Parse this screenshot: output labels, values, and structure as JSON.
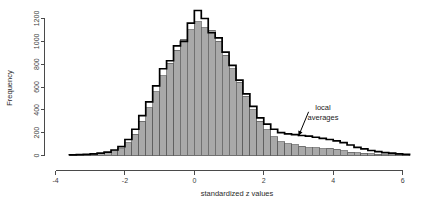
{
  "chart_data": {
    "type": "bar",
    "title": "",
    "subtitle": "",
    "xlabel": "standardized z values",
    "ylabel": "Frequency",
    "xlim": [
      -4.0,
      6.4
    ],
    "ylim": [
      0,
      1300
    ],
    "xticks": [
      -4,
      -2,
      0,
      2,
      4,
      6
    ],
    "xtick_labels": [
      "-4",
      "-2",
      "0",
      "2",
      "4",
      "6"
    ],
    "yticks": [
      0,
      200,
      400,
      600,
      800,
      1000,
      1200
    ],
    "ytick_labels": [
      "0",
      "200",
      "400",
      "600",
      "800",
      "1000",
      "1200"
    ],
    "grid": false,
    "legend_position": "none",
    "bin_width": 0.2,
    "bar_fill_color": "#a9a9a9",
    "bar_edge_color": "#5a5a5a",
    "line_color": "#000000",
    "background_color": "#ffffff",
    "annotations": [
      {
        "text_line1": "local",
        "text_line2": "averages",
        "x": 3.55,
        "y": 330,
        "arrow_to_x": 3.0,
        "arrow_to_y": 170
      }
    ],
    "series": [
      {
        "name": "histogram",
        "kind": "bars",
        "bin_centers": [
          -3.5,
          -3.3,
          -3.1,
          -2.9,
          -2.7,
          -2.5,
          -2.3,
          -2.1,
          -1.9,
          -1.7,
          -1.5,
          -1.3,
          -1.1,
          -0.9,
          -0.7,
          -0.5,
          -0.3,
          -0.1,
          0.1,
          0.3,
          0.5,
          0.7,
          0.9,
          1.1,
          1.3,
          1.5,
          1.7,
          1.9,
          2.1,
          2.3,
          2.5,
          2.7,
          2.9,
          3.1,
          3.3,
          3.5,
          3.7,
          3.9,
          4.1,
          4.3,
          4.5,
          4.7,
          4.9,
          5.1,
          5.3,
          5.5,
          5.7,
          5.9,
          6.1
        ],
        "values": [
          4,
          6,
          8,
          12,
          16,
          24,
          40,
          60,
          110,
          185,
          300,
          420,
          560,
          700,
          810,
          920,
          1020,
          1100,
          1170,
          1120,
          1095,
          1000,
          880,
          760,
          640,
          520,
          400,
          300,
          225,
          165,
          120,
          105,
          95,
          82,
          70,
          68,
          60,
          62,
          55,
          40,
          30,
          22,
          18,
          14,
          10,
          8,
          6,
          5,
          4
        ]
      },
      {
        "name": "local averages",
        "kind": "step-line",
        "bin_centers": [
          -3.5,
          -3.3,
          -3.1,
          -2.9,
          -2.7,
          -2.5,
          -2.3,
          -2.1,
          -1.9,
          -1.7,
          -1.5,
          -1.3,
          -1.1,
          -0.9,
          -0.7,
          -0.5,
          -0.3,
          -0.1,
          0.1,
          0.3,
          0.5,
          0.7,
          0.9,
          1.1,
          1.3,
          1.5,
          1.7,
          1.9,
          2.1,
          2.3,
          2.5,
          2.7,
          2.9,
          3.1,
          3.3,
          3.5,
          3.7,
          3.9,
          4.1,
          4.3,
          4.5,
          4.7,
          4.9,
          5.1,
          5.3,
          5.5,
          5.7,
          5.9,
          6.1
        ],
        "values": [
          5,
          7,
          10,
          14,
          20,
          30,
          48,
          78,
          140,
          230,
          350,
          470,
          610,
          760,
          830,
          960,
          1000,
          1160,
          1270,
          1200,
          1075,
          1030,
          905,
          790,
          660,
          540,
          430,
          330,
          275,
          230,
          200,
          190,
          182,
          175,
          170,
          160,
          150,
          140,
          128,
          112,
          92,
          72,
          58,
          44,
          34,
          26,
          20,
          14,
          9
        ]
      }
    ]
  },
  "axes": {
    "y_axis_label": "Frequency",
    "x_axis_label": "standardized z values"
  }
}
